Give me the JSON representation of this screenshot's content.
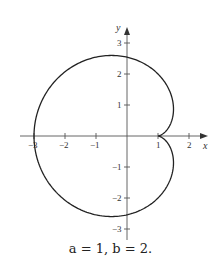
{
  "chart_data": {
    "type": "line",
    "title": "",
    "caption": "a = 1, b = 2.",
    "xlabel": "x",
    "ylabel": "y",
    "xlim": [
      -3.2,
      2.6
    ],
    "ylim": [
      -3.4,
      3.7
    ],
    "x_ticks": [
      -3,
      -2,
      -1,
      1,
      2
    ],
    "x_tick_labels": [
      "−3",
      "−2",
      "−1",
      "1",
      "2"
    ],
    "y_ticks": [
      3,
      2,
      1,
      -1,
      -2,
      -3
    ],
    "y_tick_labels": [
      "3",
      "2",
      "1",
      "−1",
      "−2",
      "−3"
    ],
    "grid": false,
    "series": [
      {
        "name": "curve",
        "parametric": "x = -2cos t - cos 2t, y = 2 sin t + sin 2t",
        "points": [
          [
            -3,
            0
          ],
          [
            -2.7,
            1.2
          ],
          [
            -2,
            2.05
          ],
          [
            -1.2,
            2.5
          ],
          [
            -0.5,
            2.6
          ],
          [
            0,
            2.5
          ],
          [
            0.6,
            2.1
          ],
          [
            1.2,
            1.3
          ],
          [
            1.5,
            0.9
          ],
          [
            1.4,
            0.5
          ],
          [
            1,
            0
          ],
          [
            1.4,
            -0.5
          ],
          [
            1.5,
            -0.9
          ],
          [
            1.2,
            -1.3
          ],
          [
            0.6,
            -2.1
          ],
          [
            0,
            -2.5
          ],
          [
            -0.5,
            -2.6
          ],
          [
            -1.2,
            -2.5
          ],
          [
            -2,
            -2.05
          ],
          [
            -2.7,
            -1.2
          ],
          [
            -3,
            0
          ]
        ]
      }
    ]
  }
}
